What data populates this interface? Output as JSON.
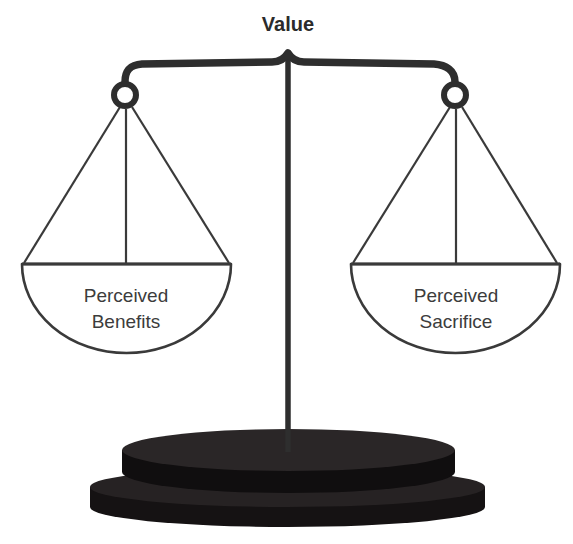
{
  "diagram": {
    "title": "Value",
    "type": "balance-scale",
    "colors": {
      "ink": "#2e2e2e",
      "line": "#3a3a3a",
      "text": "#3c3c3c",
      "title": "#2b2b2b",
      "base_top": "#231f20",
      "base_side": "#151213",
      "background": "#ffffff"
    },
    "pans": [
      {
        "side": "left",
        "label_line1": "Perceived",
        "label_line2": "Benefits"
      },
      {
        "side": "right",
        "label_line1": "Perceived",
        "label_line2": "Sacrifice"
      }
    ]
  }
}
